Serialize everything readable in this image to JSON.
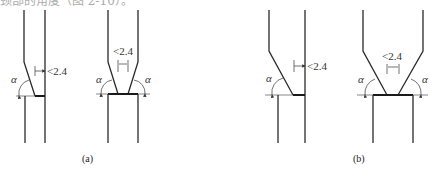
{
  "header": {
    "cut_off_text": "颈部的角度（图 2-10）。"
  },
  "figures": [
    {
      "id": "a-1",
      "angle_label": "α",
      "dimension_label": "<2.4"
    },
    {
      "id": "a-2",
      "angle_label": "α",
      "dimension_label": "<2.4"
    },
    {
      "id": "b-1",
      "angle_label": "α",
      "dimension_label": "<2.4"
    },
    {
      "id": "b-2",
      "angle_label": "α",
      "dimension_label": "<2.4"
    }
  ],
  "captions": {
    "a": "(a)",
    "b": "(b)"
  }
}
